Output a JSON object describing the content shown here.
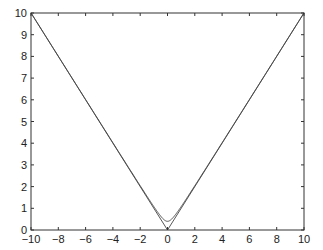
{
  "chart_data": {
    "type": "line",
    "title": "",
    "xlabel": "",
    "ylabel": "",
    "xlim": [
      -10,
      10
    ],
    "ylim": [
      0,
      10
    ],
    "grid": false,
    "legend": null,
    "xticks": [
      -10,
      -8,
      -6,
      -4,
      -2,
      0,
      2,
      4,
      6,
      8,
      10
    ],
    "yticks": [
      0,
      1,
      2,
      3,
      4,
      5,
      6,
      7,
      8,
      9,
      10
    ],
    "series": [
      {
        "name": "|x|",
        "x": [
          -10,
          0,
          10
        ],
        "y": [
          10,
          0,
          10
        ],
        "color": "#444444"
      },
      {
        "name": "smoothed |x| (sqrt(x^2 + eps))",
        "x": [
          -10,
          -2,
          -1,
          -0.5,
          -0.25,
          0,
          0.25,
          0.5,
          1,
          2,
          10
        ],
        "y": [
          10.01,
          2.04,
          1.08,
          0.64,
          0.47,
          0.4,
          0.47,
          0.64,
          1.08,
          2.04,
          10.01
        ],
        "color": "#444444"
      }
    ]
  },
  "axes": {
    "left": 31,
    "right": 304,
    "top": 13,
    "bottom": 230
  }
}
